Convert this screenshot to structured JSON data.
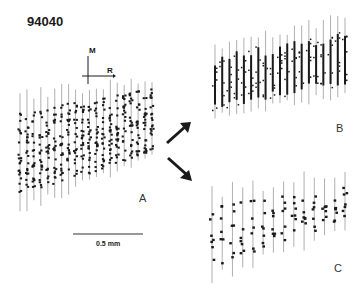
{
  "figure": {
    "id": "94040",
    "orientation": {
      "vertical_label": "M",
      "horizontal_label": "R"
    },
    "scale_bar": {
      "label": "0.5 mm",
      "length_px": 68
    },
    "arrows": [
      {
        "name": "arrow-to-B",
        "direction": "up-right"
      },
      {
        "name": "arrow-to-C",
        "direction": "down-right"
      }
    ],
    "panels": [
      {
        "label": "A",
        "style": "dense-dots",
        "x0": 20,
        "x1": 152,
        "cols": 20,
        "top_start": 110,
        "top_end": 88,
        "bottom_start": 198,
        "bottom_end": 150,
        "line_extend": 14
      },
      {
        "label": "B",
        "style": "dense-bars",
        "x0": 215,
        "x1": 345,
        "cols": 19,
        "top_start": 55,
        "top_end": 28,
        "bottom_start": 110,
        "bottom_end": 85,
        "line_extend": 12
      },
      {
        "label": "C",
        "style": "sparse-dots",
        "x0": 212,
        "x1": 345,
        "cols": 14,
        "top_start": 205,
        "top_end": 185,
        "bottom_start": 268,
        "bottom_end": 220,
        "line_extend": 15
      }
    ]
  },
  "colors": {
    "ink": "#1a1a1a",
    "line": "#7a7a7a",
    "background": "#ffffff"
  }
}
